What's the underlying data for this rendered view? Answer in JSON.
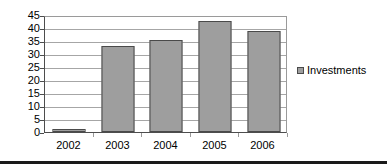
{
  "chart_data": {
    "type": "bar",
    "title": "",
    "xlabel": "",
    "ylabel": "",
    "categories": [
      "2002",
      "2003",
      "2004",
      "2005",
      "2006"
    ],
    "series": [
      {
        "name": "Investments",
        "values": [
          1,
          33,
          35.5,
          42.5,
          39
        ]
      }
    ],
    "ylim": [
      0,
      45
    ],
    "ytick_values": [
      0,
      5,
      10,
      15,
      20,
      25,
      30,
      35,
      40,
      45
    ],
    "ytick_labels": [
      "0",
      "5",
      "10",
      "15",
      "20",
      "25",
      "30",
      "35",
      "40",
      "45"
    ],
    "grid": true,
    "legend_position": "right",
    "colors": {
      "bar_fill": "#9e9e9e",
      "bar_edge": "#4a4a4a",
      "gridline": "#a6a6a6",
      "axis": "#4d4d4d",
      "text": "#000000",
      "rule": "#1a1a1a"
    }
  },
  "legend": {
    "entries": [
      {
        "label": "Investments",
        "marker": "legend-square-marker"
      }
    ]
  }
}
